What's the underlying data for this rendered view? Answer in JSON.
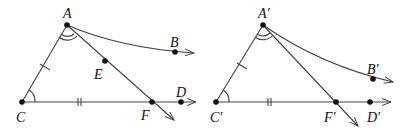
{
  "figures": [
    {
      "id": "left",
      "points": {
        "A": {
          "label": "A",
          "x": 67,
          "y": 25
        },
        "B": {
          "label": "B",
          "x": 175,
          "y": 52
        },
        "C": {
          "label": "C",
          "x": 22,
          "y": 102
        },
        "D": {
          "label": "D",
          "x": 181,
          "y": 102
        },
        "E": {
          "label": "E",
          "x": 105,
          "y": 61
        },
        "F": {
          "label": "F",
          "x": 152,
          "y": 102
        }
      }
    },
    {
      "id": "right",
      "points": {
        "A": {
          "label": "A′",
          "x": 263,
          "y": 25
        },
        "B": {
          "label": "B′",
          "x": 373,
          "y": 79
        },
        "C": {
          "label": "C′",
          "x": 216,
          "y": 102
        },
        "D": {
          "label": "D′",
          "x": 370,
          "y": 102
        },
        "F": {
          "label": "F′",
          "x": 336,
          "y": 102
        }
      }
    }
  ],
  "colors": {
    "line": "#444444",
    "point": "#111111",
    "background": "#ffffff"
  }
}
